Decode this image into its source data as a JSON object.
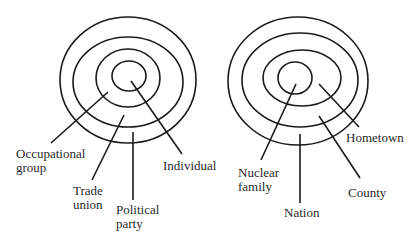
{
  "colors": {
    "background": "#ffffff",
    "stroke": "#1a1a1a",
    "text": "#2a2a2a"
  },
  "diagrams": [
    {
      "name": "left-concentric-diagram",
      "rings": [
        {
          "cx": 128,
          "cy": 80,
          "rx": 68,
          "ry": 63
        },
        {
          "cx": 128,
          "cy": 82,
          "rx": 55,
          "ry": 45
        },
        {
          "cx": 128,
          "cy": 78,
          "rx": 32,
          "ry": 29
        },
        {
          "cx": 129,
          "cy": 76,
          "rx": 17,
          "ry": 15
        }
      ],
      "labels": [
        {
          "id": "occupational-group",
          "lines": [
            "Occupational",
            "group"
          ],
          "x": 16,
          "y": 158,
          "leader": [
            108,
            92,
            51,
            143
          ]
        },
        {
          "id": "trade-union",
          "lines": [
            "Trade",
            "union"
          ],
          "x": 73,
          "y": 195,
          "leader": [
            124,
            115,
            92,
            180
          ]
        },
        {
          "id": "political-party",
          "lines": [
            "Political",
            "party"
          ],
          "x": 116,
          "y": 214,
          "leader": [
            133,
            132,
            133,
            200
          ]
        },
        {
          "id": "individual",
          "lines": [
            "Individual"
          ],
          "x": 163,
          "y": 170,
          "leader": [
            131,
            81,
            182,
            154
          ]
        }
      ]
    },
    {
      "name": "right-concentric-diagram",
      "rings": [
        {
          "cx": 298,
          "cy": 81,
          "rx": 70,
          "ry": 64
        },
        {
          "cx": 300,
          "cy": 80,
          "rx": 58,
          "ry": 47
        },
        {
          "cx": 302,
          "cy": 78,
          "rx": 39,
          "ry": 28
        },
        {
          "cx": 295,
          "cy": 78,
          "rx": 17,
          "ry": 16
        }
      ],
      "labels": [
        {
          "id": "nuclear-family",
          "lines": [
            "Nuclear",
            "family"
          ],
          "x": 238,
          "y": 177,
          "leader": [
            296,
            84,
            261,
            160
          ]
        },
        {
          "id": "nation",
          "lines": [
            "Nation"
          ],
          "x": 284,
          "y": 217,
          "leader": [
            300,
            134,
            300,
            203
          ]
        },
        {
          "id": "county",
          "lines": [
            "County"
          ],
          "x": 348,
          "y": 197,
          "leader": [
            319,
            116,
            360,
            178
          ]
        },
        {
          "id": "hometown",
          "lines": [
            "Hometown"
          ],
          "x": 346,
          "y": 142,
          "leader": [
            319,
            84,
            359,
            127
          ]
        }
      ]
    }
  ]
}
